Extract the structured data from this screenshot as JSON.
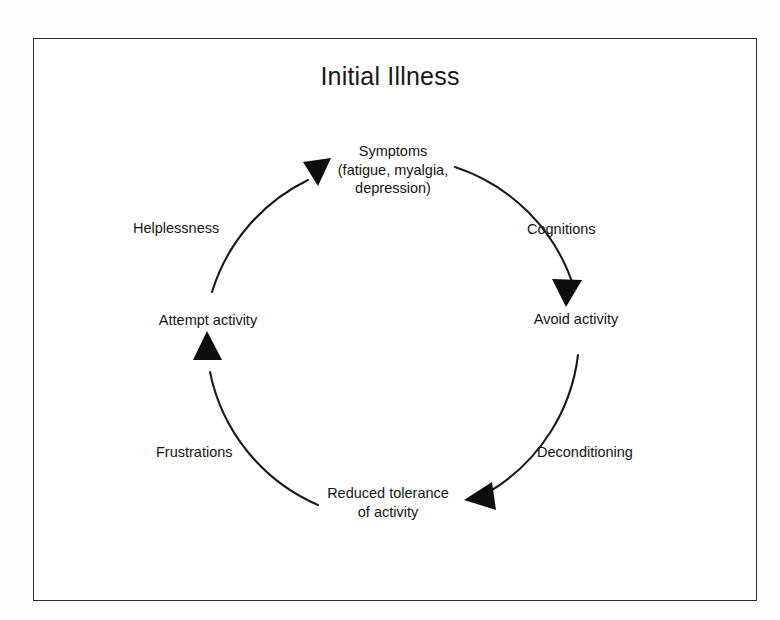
{
  "figure": {
    "title": "Initial Illness",
    "type": "cycle-diagram",
    "direction": "clockwise",
    "frame": {
      "border_color": "#2b2b2b",
      "background": "#ffffff"
    },
    "text_color": "#141414",
    "nodes": [
      {
        "id": "symptoms",
        "position": "top",
        "lines": [
          "Symptoms",
          "(fatigue, myalgia,",
          "depression)"
        ]
      },
      {
        "id": "avoid-activity",
        "position": "right",
        "lines": [
          "Avoid activity"
        ]
      },
      {
        "id": "reduced-tolerance",
        "position": "bottom",
        "lines": [
          "Reduced tolerance",
          "of activity"
        ]
      },
      {
        "id": "attempt-activity",
        "position": "left",
        "lines": [
          "Attempt activity"
        ]
      }
    ],
    "edges": [
      {
        "id": "cognitions",
        "label": "Cognitions",
        "from": "symptoms",
        "to": "avoid-activity",
        "side": "upper-right"
      },
      {
        "id": "deconditioning",
        "label": "Deconditioning",
        "from": "avoid-activity",
        "to": "reduced-tolerance",
        "side": "lower-right"
      },
      {
        "id": "frustrations",
        "label": "Frustrations",
        "from": "reduced-tolerance",
        "to": "attempt-activity",
        "side": "lower-left"
      },
      {
        "id": "helplessness",
        "label": "Helplessness",
        "from": "attempt-activity",
        "to": "symptoms",
        "side": "upper-left"
      }
    ]
  }
}
